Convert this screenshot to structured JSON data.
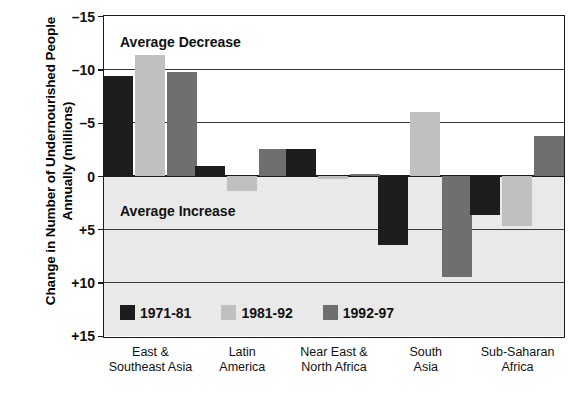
{
  "chart_data": {
    "type": "bar",
    "title": "",
    "xlabel": "",
    "ylabel": "Change in Number of Undernourished People Annually (millions)",
    "ylim": [
      -15,
      15
    ],
    "y_inverted": true,
    "grid": true,
    "legend_position": "inside-bottom-left",
    "y_ticks": [
      "–15",
      "–10",
      "–5",
      "0",
      "+5",
      "+10",
      "+15"
    ],
    "y_tick_values": [
      -15,
      -10,
      -5,
      0,
      5,
      10,
      15
    ],
    "categories": [
      "East &\nSoutheast Asia",
      "Latin\nAmerica",
      "Near East &\nNorth Africa",
      "South\nAsia",
      "Sub-Saharan\nAfrica"
    ],
    "series": [
      {
        "name": "1971-81",
        "color": "#1d1d1d",
        "values": [
          -9.4,
          -0.9,
          -2.5,
          6.5,
          3.7
        ]
      },
      {
        "name": "1981-92",
        "color": "#c0c0c0",
        "values": [
          -11.3,
          1.4,
          0.3,
          -6.0,
          4.7
        ]
      },
      {
        "name": "1992-97",
        "color": "#6f6f6f",
        "values": [
          -9.7,
          -2.5,
          -0.2,
          9.5,
          -3.7
        ]
      }
    ],
    "annotations": [
      {
        "text": "Average Decrease",
        "region": "upper"
      },
      {
        "text": "Average Increase",
        "region": "lower"
      }
    ]
  },
  "colors": {
    "series_1971_81": "#1d1d1d",
    "series_1981_92": "#c0c0c0",
    "series_1992_97": "#6f6f6f",
    "shaded_region": "#e9e9e9",
    "axis": "#1a1a1a",
    "background": "#ffffff"
  }
}
